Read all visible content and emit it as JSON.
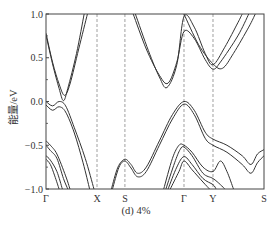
{
  "chart_data": {
    "type": "line",
    "title": "",
    "caption": "(d) 4%",
    "xlabel": "",
    "ylabel": "能量/eV",
    "ylim": [
      -1.0,
      1.0
    ],
    "yticks": [
      1.0,
      0.5,
      0.0,
      -0.5,
      -1.0
    ],
    "ytick_labels": [
      "1.0",
      "0.5",
      "0.0",
      "−0.5",
      "−1.0"
    ],
    "k_path": [
      "Γ",
      "X",
      "S",
      "Γ",
      "Y",
      "S"
    ],
    "k_positions": [
      0.0,
      0.234,
      0.362,
      0.633,
      0.766,
      1.0
    ],
    "vertical_dashed_lines_at": [
      "X",
      "S",
      "Γ",
      "Y"
    ],
    "grid": false,
    "legend": null,
    "series": [
      {
        "name": "CB1",
        "points": [
          [
            0.0,
            0.78
          ],
          [
            0.03,
            0.45
          ],
          [
            0.06,
            0.2
          ],
          [
            0.085,
            0.07
          ],
          [
            0.11,
            0.2
          ],
          [
            0.15,
            0.6
          ],
          [
            0.19,
            1.0
          ]
        ]
      },
      {
        "name": "CB2",
        "points": [
          [
            0.0,
            0.76
          ],
          [
            0.03,
            0.43
          ],
          [
            0.06,
            0.15
          ],
          [
            0.08,
            0.01
          ],
          [
            0.1,
            0.15
          ],
          [
            0.14,
            0.55
          ],
          [
            0.175,
            1.0
          ]
        ]
      },
      {
        "name": "CB3",
        "points": [
          [
            0.4,
            1.0
          ],
          [
            0.46,
            0.6
          ],
          [
            0.52,
            0.3
          ],
          [
            0.56,
            0.21
          ],
          [
            0.6,
            0.45
          ],
          [
            0.633,
            0.8
          ],
          [
            0.68,
            0.72
          ],
          [
            0.73,
            0.48
          ],
          [
            0.766,
            0.37
          ],
          [
            0.8,
            0.45
          ],
          [
            0.88,
            0.75
          ],
          [
            0.93,
            1.0
          ]
        ]
      },
      {
        "name": "CB4",
        "points": [
          [
            0.41,
            1.0
          ],
          [
            0.47,
            0.58
          ],
          [
            0.52,
            0.28
          ],
          [
            0.555,
            0.16
          ],
          [
            0.6,
            0.42
          ],
          [
            0.633,
            0.97
          ],
          [
            0.68,
            0.85
          ],
          [
            0.73,
            0.55
          ],
          [
            0.766,
            0.42
          ],
          [
            0.82,
            0.62
          ],
          [
            0.88,
            0.9
          ],
          [
            0.9,
            1.0
          ]
        ]
      },
      {
        "name": "CB5",
        "points": [
          [
            0.633,
            1.0
          ],
          [
            0.7,
            0.65
          ],
          [
            0.766,
            0.43
          ],
          [
            0.81,
            0.38
          ],
          [
            0.86,
            0.55
          ],
          [
            0.93,
            0.85
          ],
          [
            0.96,
            1.0
          ]
        ]
      },
      {
        "name": "VB1",
        "points": [
          [
            0.0,
            0.0
          ],
          [
            0.03,
            -0.05
          ],
          [
            0.06,
            0.0
          ],
          [
            0.09,
            -0.05
          ],
          [
            0.13,
            -0.3
          ],
          [
            0.18,
            -0.65
          ],
          [
            0.22,
            -1.0
          ]
        ]
      },
      {
        "name": "VB2",
        "points": [
          [
            0.0,
            -0.04
          ],
          [
            0.03,
            -0.1
          ],
          [
            0.06,
            -0.06
          ],
          [
            0.09,
            -0.12
          ],
          [
            0.13,
            -0.36
          ],
          [
            0.17,
            -0.7
          ],
          [
            0.2,
            -1.0
          ]
        ]
      },
      {
        "name": "VB3",
        "points": [
          [
            0.0,
            -0.45
          ],
          [
            0.02,
            -0.5
          ],
          [
            0.05,
            -0.6
          ],
          [
            0.09,
            -0.85
          ],
          [
            0.11,
            -1.0
          ]
        ]
      },
      {
        "name": "VB4",
        "points": [
          [
            0.0,
            -0.5
          ],
          [
            0.02,
            -0.56
          ],
          [
            0.05,
            -0.65
          ],
          [
            0.08,
            -0.88
          ],
          [
            0.1,
            -1.0
          ]
        ]
      },
      {
        "name": "VB5",
        "points": [
          [
            0.0,
            -0.62
          ],
          [
            0.02,
            -0.67
          ],
          [
            0.05,
            -0.8
          ],
          [
            0.075,
            -1.0
          ]
        ]
      },
      {
        "name": "VB6",
        "points": [
          [
            0.0,
            -0.66
          ],
          [
            0.02,
            -0.72
          ],
          [
            0.04,
            -0.85
          ],
          [
            0.06,
            -1.0
          ]
        ]
      },
      {
        "name": "VB7",
        "points": [
          [
            0.3,
            -1.0
          ],
          [
            0.33,
            -0.75
          ],
          [
            0.362,
            -0.66
          ],
          [
            0.39,
            -0.72
          ],
          [
            0.42,
            -0.82
          ],
          [
            0.46,
            -0.75
          ],
          [
            0.52,
            -0.45
          ],
          [
            0.58,
            -0.15
          ],
          [
            0.633,
            0.0
          ],
          [
            0.68,
            -0.1
          ],
          [
            0.73,
            -0.35
          ],
          [
            0.766,
            -0.43
          ],
          [
            0.83,
            -0.5
          ],
          [
            0.9,
            -0.62
          ],
          [
            0.94,
            -0.72
          ],
          [
            0.97,
            -0.6
          ],
          [
            1.0,
            -0.55
          ]
        ]
      },
      {
        "name": "VB8",
        "points": [
          [
            0.305,
            -1.0
          ],
          [
            0.335,
            -0.75
          ],
          [
            0.362,
            -0.68
          ],
          [
            0.39,
            -0.76
          ],
          [
            0.42,
            -0.86
          ],
          [
            0.46,
            -0.8
          ],
          [
            0.52,
            -0.5
          ],
          [
            0.58,
            -0.2
          ],
          [
            0.633,
            -0.03
          ],
          [
            0.68,
            -0.15
          ],
          [
            0.73,
            -0.42
          ],
          [
            0.766,
            -0.5
          ],
          [
            0.83,
            -0.58
          ],
          [
            0.9,
            -0.72
          ],
          [
            0.94,
            -0.82
          ],
          [
            0.97,
            -0.7
          ],
          [
            1.0,
            -0.62
          ]
        ]
      },
      {
        "name": "VB9",
        "points": [
          [
            0.54,
            -1.0
          ],
          [
            0.58,
            -0.65
          ],
          [
            0.61,
            -0.5
          ],
          [
            0.633,
            -0.5
          ],
          [
            0.67,
            -0.58
          ],
          [
            0.72,
            -0.75
          ],
          [
            0.766,
            -0.8
          ],
          [
            0.8,
            -0.68
          ],
          [
            0.83,
            -0.8
          ],
          [
            0.86,
            -1.0
          ]
        ]
      },
      {
        "name": "VB10",
        "points": [
          [
            0.55,
            -1.0
          ],
          [
            0.59,
            -0.7
          ],
          [
            0.615,
            -0.55
          ],
          [
            0.633,
            -0.52
          ],
          [
            0.67,
            -0.62
          ],
          [
            0.72,
            -0.82
          ],
          [
            0.766,
            -0.88
          ],
          [
            0.8,
            -0.95
          ],
          [
            0.82,
            -1.0
          ]
        ]
      },
      {
        "name": "VB11",
        "points": [
          [
            0.56,
            -1.0
          ],
          [
            0.6,
            -0.75
          ],
          [
            0.633,
            -0.63
          ],
          [
            0.67,
            -0.72
          ],
          [
            0.72,
            -0.88
          ],
          [
            0.766,
            -0.95
          ],
          [
            0.78,
            -1.0
          ]
        ]
      },
      {
        "name": "VB12",
        "points": [
          [
            0.57,
            -1.0
          ],
          [
            0.61,
            -0.8
          ],
          [
            0.633,
            -0.68
          ],
          [
            0.67,
            -0.78
          ],
          [
            0.72,
            -0.92
          ],
          [
            0.75,
            -1.0
          ]
        ]
      }
    ]
  }
}
